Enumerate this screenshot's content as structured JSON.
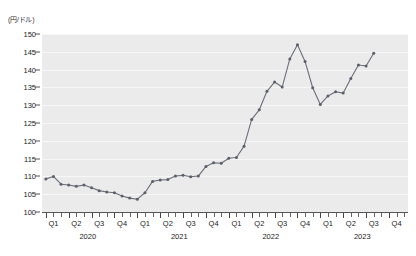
{
  "chart_data": {
    "type": "line",
    "title": "",
    "subtitle": "",
    "xlabel": "",
    "ylabel": "(円/ドル)",
    "ylim": [
      100,
      150
    ],
    "ytick_values": [
      100,
      105,
      110,
      115,
      120,
      125,
      130,
      135,
      140,
      145,
      150
    ],
    "ytick_labels": [
      "100",
      "105",
      "110",
      "115",
      "120",
      "125",
      "130",
      "135",
      "140",
      "145",
      "150"
    ],
    "grid": true,
    "grid_axis": "y",
    "legend": false,
    "legend_position": "none",
    "line_color": "#6b6f7a",
    "marker_color": "#5a5f6a",
    "plot_background": "#ebebeb",
    "x_quarters": [
      {
        "label": "Q1",
        "year": "2020"
      },
      {
        "label": "Q2",
        "year": "2020"
      },
      {
        "label": "Q3",
        "year": "2020"
      },
      {
        "label": "Q4",
        "year": "2020"
      },
      {
        "label": "Q1",
        "year": "2021"
      },
      {
        "label": "Q2",
        "year": "2021"
      },
      {
        "label": "Q3",
        "year": "2021"
      },
      {
        "label": "Q4",
        "year": "2021"
      },
      {
        "label": "Q1",
        "year": "2022"
      },
      {
        "label": "Q2",
        "year": "2022"
      },
      {
        "label": "Q3",
        "year": "2022"
      },
      {
        "label": "Q4",
        "year": "2022"
      },
      {
        "label": "Q1",
        "year": "2023"
      },
      {
        "label": "Q2",
        "year": "2023"
      },
      {
        "label": "Q3",
        "year": "2023"
      },
      {
        "label": "Q4",
        "year": "2023"
      }
    ],
    "year_labels": [
      "2020",
      "2021",
      "2022",
      "2023"
    ],
    "x": [
      "2020-01",
      "2020-02",
      "2020-03",
      "2020-04",
      "2020-05",
      "2020-06",
      "2020-07",
      "2020-08",
      "2020-09",
      "2020-10",
      "2020-11",
      "2020-12",
      "2021-01",
      "2021-02",
      "2021-03",
      "2021-04",
      "2021-05",
      "2021-06",
      "2021-07",
      "2021-08",
      "2021-09",
      "2021-10",
      "2021-11",
      "2021-12",
      "2022-01",
      "2022-02",
      "2022-03",
      "2022-04",
      "2022-05",
      "2022-06",
      "2022-07",
      "2022-08",
      "2022-09",
      "2022-10",
      "2022-11",
      "2022-12",
      "2023-01",
      "2023-02",
      "2023-03",
      "2023-04",
      "2023-05",
      "2023-06",
      "2023-07",
      "2023-08"
    ],
    "values": [
      109.3,
      110.0,
      107.8,
      107.6,
      107.2,
      107.6,
      106.8,
      106.0,
      105.6,
      105.4,
      104.5,
      103.9,
      103.6,
      105.4,
      108.6,
      109.0,
      109.1,
      110.1,
      110.3,
      109.9,
      110.1,
      112.8,
      113.8,
      113.7,
      115.1,
      115.3,
      118.5,
      126.0,
      128.7,
      133.9,
      136.5,
      135.1,
      143.0,
      147.0,
      142.3,
      134.9,
      130.2,
      132.6,
      133.8,
      133.4,
      137.5,
      141.3,
      141.0,
      144.6
    ],
    "annotations": []
  }
}
